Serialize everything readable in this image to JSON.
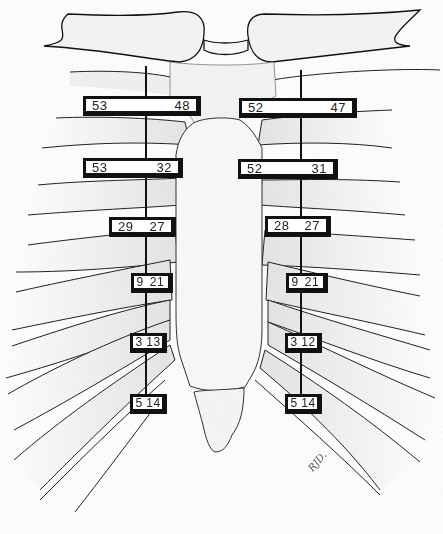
{
  "diagram": {
    "colors": {
      "ink": "#111111",
      "bone_fill": "#f4f4f4",
      "stipple": "#9a9a9a",
      "background": "#ffffff"
    },
    "left_side": {
      "labels": [
        {
          "left": "53",
          "right": "48"
        },
        {
          "left": "53",
          "right": "32"
        },
        {
          "left": "29",
          "right": "27"
        },
        {
          "left": "9",
          "right": "21"
        },
        {
          "left": "3",
          "right": "13"
        },
        {
          "left": "5",
          "right": "14"
        }
      ]
    },
    "right_side": {
      "labels": [
        {
          "left": "52",
          "right": "47"
        },
        {
          "left": "52",
          "right": "31"
        },
        {
          "left": "28",
          "right": "27"
        },
        {
          "left": "9",
          "right": "21"
        },
        {
          "left": "3",
          "right": "12"
        },
        {
          "left": "5",
          "right": "14"
        }
      ]
    },
    "signature": "RJD."
  }
}
